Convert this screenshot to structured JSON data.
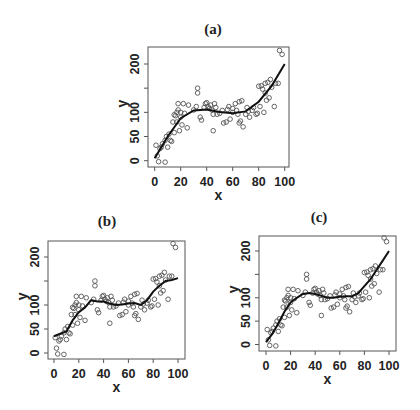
{
  "figure": {
    "panels": [
      {
        "id": "a",
        "title": "(a)",
        "xlabel": "x",
        "ylabel": "y"
      },
      {
        "id": "b",
        "title": "(b)",
        "xlabel": "x",
        "ylabel": "y"
      },
      {
        "id": "c",
        "title": "(c)",
        "xlabel": "x",
        "ylabel": "y"
      }
    ]
  },
  "chart_data": [
    {
      "type": "scatter",
      "title": "(a)",
      "xlabel": "x",
      "ylabel": "y",
      "xlim": [
        0,
        100
      ],
      "ylim": [
        -5,
        225
      ],
      "xticks": [
        0,
        20,
        40,
        60,
        80,
        100
      ],
      "yticks": [
        0,
        50,
        100,
        200
      ],
      "grid": false,
      "legend": null,
      "series": [
        {
          "name": "observations",
          "kind": "points",
          "x": [
            1,
            2,
            3,
            4,
            5,
            6,
            8,
            8,
            9,
            10,
            11,
            12,
            13,
            14,
            15,
            15,
            16,
            17,
            17,
            18,
            18,
            19,
            20,
            20,
            21,
            22,
            23,
            25,
            26,
            30,
            32,
            33,
            33,
            35,
            36,
            38,
            39,
            40,
            41,
            42,
            43,
            44,
            45,
            45,
            46,
            47,
            48,
            50,
            52,
            53,
            55,
            56,
            57,
            58,
            60,
            60,
            62,
            63,
            64,
            65,
            65,
            66,
            67,
            68,
            70,
            71,
            72,
            73,
            75,
            76,
            78,
            79,
            80,
            81,
            82,
            83,
            84,
            85,
            85,
            86,
            87,
            88,
            89,
            90,
            92,
            93,
            95,
            96,
            98
          ],
          "y": [
            32,
            10,
            -2,
            25,
            28,
            35,
            -3,
            42,
            50,
            28,
            55,
            42,
            40,
            80,
            58,
            95,
            93,
            100,
            80,
            118,
            105,
            62,
            100,
            90,
            74,
            118,
            98,
            68,
            115,
            105,
            112,
            150,
            140,
            90,
            84,
            110,
            118,
            120,
            112,
            108,
            115,
            105,
            96,
            62,
            118,
            110,
            96,
            98,
            104,
            78,
            80,
            106,
            112,
            86,
            100,
            108,
            118,
            104,
            96,
            122,
            78,
            82,
            124,
            70,
            96,
            110,
            102,
            90,
            104,
            110,
            96,
            98,
            154,
            112,
            155,
            148,
            100,
            140,
            160,
            125,
            162,
            130,
            168,
            152,
            112,
            160,
            160,
            228,
            220
          ]
        },
        {
          "name": "fitted cubic",
          "kind": "line",
          "x": [
            0,
            10,
            20,
            30,
            40,
            50,
            60,
            70,
            80,
            90,
            100
          ],
          "y": [
            5,
            50,
            88,
            104,
            106,
            101,
            98,
            102,
            122,
            155,
            200
          ]
        }
      ]
    },
    {
      "type": "scatter",
      "title": "(b)",
      "xlabel": "x",
      "ylabel": "y",
      "xlim": [
        0,
        100
      ],
      "ylim": [
        -5,
        225
      ],
      "xticks": [
        0,
        20,
        40,
        60,
        80,
        100
      ],
      "yticks": [
        0,
        50,
        100,
        200
      ],
      "grid": false,
      "legend": null,
      "series": [
        {
          "name": "observations",
          "kind": "points",
          "same_as_panel": "a"
        },
        {
          "name": "smoother",
          "kind": "line",
          "x": [
            0,
            5,
            10,
            15,
            20,
            25,
            30,
            35,
            40,
            45,
            50,
            55,
            60,
            65,
            70,
            75,
            80,
            85,
            90,
            95,
            100
          ],
          "y": [
            35,
            40,
            45,
            68,
            85,
            95,
            110,
            107,
            107,
            103,
            100,
            101,
            103,
            104,
            100,
            110,
            128,
            140,
            150,
            152,
            156
          ]
        }
      ]
    },
    {
      "type": "scatter",
      "title": "(c)",
      "xlabel": "x",
      "ylabel": "y",
      "xlim": [
        0,
        100
      ],
      "ylim": [
        -5,
        225
      ],
      "xticks": [
        0,
        20,
        40,
        60,
        80,
        100
      ],
      "yticks": [
        0,
        50,
        100,
        200
      ],
      "grid": false,
      "legend": null,
      "series": [
        {
          "name": "observations",
          "kind": "points",
          "same_as_panel": "a"
        },
        {
          "name": "smoother",
          "kind": "line",
          "x": [
            0,
            5,
            10,
            15,
            20,
            25,
            30,
            35,
            40,
            45,
            50,
            55,
            60,
            65,
            70,
            75,
            80,
            85,
            90,
            95,
            100
          ],
          "y": [
            5,
            22,
            45,
            70,
            90,
            100,
            108,
            110,
            108,
            104,
            100,
            100,
            102,
            103,
            103,
            110,
            125,
            140,
            160,
            180,
            200
          ]
        }
      ]
    }
  ]
}
